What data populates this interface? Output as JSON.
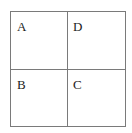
{
  "diagram": {
    "type": "2x2 grid",
    "cells": [
      {
        "position": "top-left",
        "label": "A"
      },
      {
        "position": "top-right",
        "label": "D"
      },
      {
        "position": "bottom-left",
        "label": "B"
      },
      {
        "position": "bottom-right",
        "label": "C"
      }
    ],
    "line_color": "#7a7a7a",
    "text_color": "#222222"
  }
}
